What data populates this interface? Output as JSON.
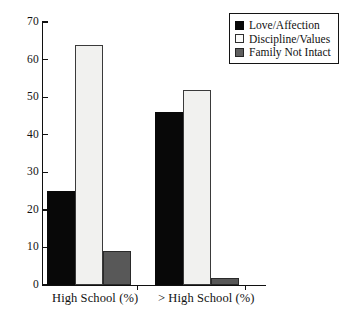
{
  "chart_data": {
    "type": "bar",
    "title": "",
    "subtitle": "",
    "xlabel": "",
    "ylabel": "",
    "ylim": [
      0,
      70
    ],
    "yticks": [
      0,
      10,
      20,
      30,
      40,
      50,
      60,
      70
    ],
    "ytick_labels": [
      "0",
      "10",
      "20",
      "30",
      "40",
      "50",
      "60",
      "70"
    ],
    "grid": false,
    "legend_position": "top-right",
    "categories": [
      "High School (%)",
      "> High School (%)"
    ],
    "series": [
      {
        "name": "Love/Affection",
        "color": "#080808",
        "values": [
          25,
          46
        ]
      },
      {
        "name": "Discipline/Values",
        "color": "#f1f1ef",
        "values": [
          64,
          52
        ]
      },
      {
        "name": "Family Not Intact",
        "color": "#585858",
        "values": [
          9,
          2
        ]
      }
    ]
  },
  "legend": {
    "items": [
      {
        "label": "Love/Affection",
        "swatch": "black"
      },
      {
        "label": "Discipline/Values",
        "swatch": "light"
      },
      {
        "label": "Family Not Intact",
        "swatch": "gray"
      }
    ]
  },
  "axes": {
    "y": {
      "labels": [
        "70",
        "60",
        "50",
        "40",
        "30",
        "20",
        "10",
        "0"
      ]
    },
    "x": {
      "labels": [
        "High School (%)",
        "> High School (%)"
      ]
    }
  }
}
